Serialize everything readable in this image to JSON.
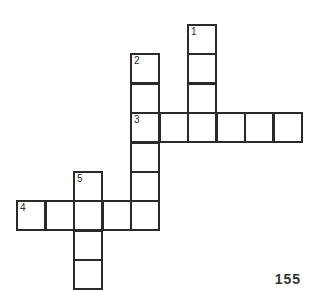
{
  "puzzle": {
    "type": "crossword",
    "grid_origin": {
      "x": 17,
      "y": 25
    },
    "cell_size": {
      "w": 28.5,
      "h": 29.4
    },
    "line_color": "#2a2a2a",
    "entries": [
      {
        "number": "1",
        "direction": "down",
        "row": 0,
        "col": 6,
        "length": 4
      },
      {
        "number": "2",
        "direction": "down",
        "row": 1,
        "col": 4,
        "length": 6
      },
      {
        "number": "3",
        "direction": "across",
        "row": 3,
        "col": 4,
        "length": 6
      },
      {
        "number": "4",
        "direction": "across",
        "row": 6,
        "col": 0,
        "length": 5
      },
      {
        "number": "5",
        "direction": "down",
        "row": 5,
        "col": 2,
        "length": 4
      }
    ]
  },
  "footer": {
    "page_number": "155"
  }
}
